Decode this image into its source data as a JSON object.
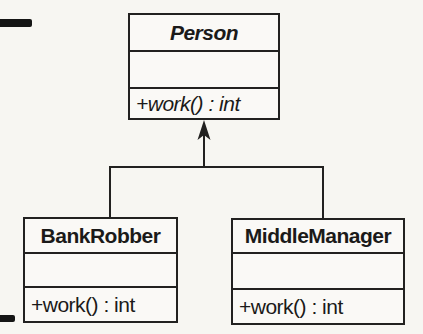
{
  "diagram": {
    "kind": "uml-class-diagram",
    "classes": [
      {
        "id": "person",
        "name": "Person",
        "abstract": true,
        "attributes": [],
        "methods": [
          "+work() : int"
        ]
      },
      {
        "id": "bankrobber",
        "name": "BankRobber",
        "abstract": false,
        "attributes": [],
        "methods": [
          "+work() : int"
        ]
      },
      {
        "id": "middlemanager",
        "name": "MiddleManager",
        "abstract": false,
        "attributes": [],
        "methods": [
          "+work() : int"
        ]
      }
    ],
    "relations": [
      {
        "type": "generalization",
        "from": "BankRobber",
        "to": "Person"
      },
      {
        "type": "generalization",
        "from": "MiddleManager",
        "to": "Person"
      }
    ],
    "colors": {
      "line": "#222120",
      "text": "#1b1a19",
      "paper_background": "#f7f6f2",
      "box_fill": "#faf9f6",
      "margin_tick": "#151515"
    }
  }
}
